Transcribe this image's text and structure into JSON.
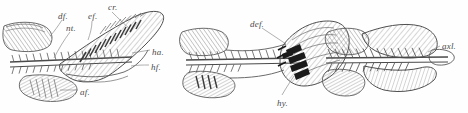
{
  "figure": {
    "background_color": "#fefefe",
    "ink_color": "#555555",
    "dark_fill_color": "#1a1a1a",
    "width": 468,
    "height": 113,
    "panel_count": 3
  },
  "panels": [
    {
      "id": "panel-1",
      "name": "heterocercal-caudal-skeleton",
      "labels": [
        {
          "key": "df",
          "text": "df.",
          "x": 58,
          "y": 12
        },
        {
          "key": "nt",
          "text": "nt.",
          "x": 66,
          "y": 24
        },
        {
          "key": "ef",
          "text": "ef.",
          "x": 88,
          "y": 12
        },
        {
          "key": "cr",
          "text": "cr.",
          "x": 108,
          "y": 3
        },
        {
          "key": "ha",
          "text": "ha.",
          "x": 152,
          "y": 48
        },
        {
          "key": "hf",
          "text": "hf.",
          "x": 151,
          "y": 63
        },
        {
          "key": "af",
          "text": "af.",
          "x": 80,
          "y": 88
        }
      ]
    },
    {
      "id": "panel-2",
      "name": "homocercal-caudal-skeleton",
      "labels": [
        {
          "key": "def",
          "text": "def.",
          "x": 250,
          "y": 20
        },
        {
          "key": "hy",
          "text": "hy.",
          "x": 277,
          "y": 99
        }
      ]
    },
    {
      "id": "panel-3",
      "name": "diphycercal-caudal-skeleton",
      "labels": [
        {
          "key": "axl",
          "text": "axl.",
          "x": 442,
          "y": 42
        }
      ]
    }
  ],
  "legend_keys": {
    "df": "dorsal fin",
    "nt": "notochord",
    "ef": "epaxial fin rays",
    "cr": "caudal rays",
    "ha": "haemal arch",
    "hf": "hypaxial fin",
    "af": "anal fin",
    "def": "dorsal epaxial fin",
    "hy": "hypural",
    "axl": "axial lobe"
  }
}
